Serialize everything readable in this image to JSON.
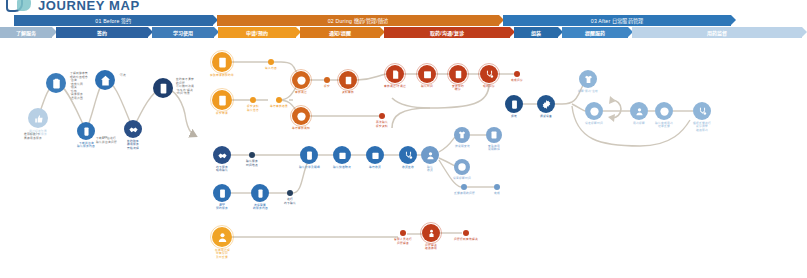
{
  "header": {
    "title": "JOURNEY MAP",
    "logo_icon": "journey-map-logo-icon"
  },
  "banner": {
    "phases": [
      {
        "id": "before",
        "label": "01 Before  签约",
        "color": "#2d6aa8",
        "width": 199
      },
      {
        "id": "during",
        "label": "02 During  缴药/管理/随访",
        "color": "#d1741f",
        "width": 282
      },
      {
        "id": "after",
        "label": "03 After 日常服药管理",
        "color": "#2e77b8",
        "width": 228
      }
    ],
    "steps": [
      {
        "id": "know-service",
        "label": "了解服务",
        "color": "#9fb8cf",
        "width": 52
      },
      {
        "id": "sign",
        "label": "签约",
        "color": "#2d62a0",
        "width": 92
      },
      {
        "id": "learn-use",
        "label": "学习使用",
        "color": "#3f7cb8",
        "width": 62
      },
      {
        "id": "apply-book",
        "label": "申请/预约",
        "color": "#ef9a21",
        "width": 78
      },
      {
        "id": "remind-remind",
        "label": "通知/提醒",
        "color": "#d97a1c",
        "width": 80
      },
      {
        "id": "take-comm-visit",
        "label": "取药/沟通/复诊",
        "color": "#bf3d1b",
        "width": 126
      },
      {
        "id": "assemble",
        "label": "组装",
        "color": "#2a6ba8",
        "width": 44
      },
      {
        "id": "continue-service",
        "label": "提醒服药",
        "color": "#3f86c4",
        "width": 66
      },
      {
        "id": "medication-supervise",
        "label": "用药监督",
        "color": "#bcd3e8",
        "width": 170
      }
    ]
  },
  "sections": {
    "before": {
      "nodes": [
        {
          "id": "b1",
          "icon": "thumbs-up-icon",
          "label": "通过好友/下属\n推荐分享服务",
          "color": "#b7cfe4",
          "x": 38,
          "y": 118,
          "r": 10
        },
        {
          "id": "b2",
          "icon": "clipboard-icon",
          "label": "",
          "color": "#3b7cba",
          "x": 56,
          "y": 83,
          "r": 10
        },
        {
          "id": "b3",
          "icon": "phone-icon",
          "label": "下载并咨询\n确认服务内容",
          "color": "#2f72b4",
          "x": 86,
          "y": 131,
          "r": 9
        },
        {
          "id": "b4",
          "icon": "home-icon",
          "label": "",
          "color": "#2d6fb2",
          "x": 105,
          "y": 80,
          "r": 10
        },
        {
          "id": "b5",
          "icon": "handshake-icon",
          "label": "签约购买\n使用服务\n开始流程",
          "color": "#2a4f86",
          "x": 133,
          "y": 129,
          "r": 9
        },
        {
          "id": "b6",
          "icon": "tablet-icon",
          "label": "",
          "color": "#1f3f6e",
          "x": 163,
          "y": 88,
          "r": 10
        }
      ],
      "notes": [
        {
          "id": "b2-note",
          "text": "了解到健康管\n理的价值理念\n·咨询\n·自我认同\n·相关\n·价格\n·具体服务\n·适用范围",
          "x": 70,
          "y": 72
        },
        {
          "id": "b4-note",
          "text": "·可选",
          "x": 119,
          "y": 74
        },
        {
          "id": "b6-note",
          "text": "签约有不清楚\n的问题\n可以随时沟通\n·怎么办·解决\n·时间·效果",
          "x": 176,
          "y": 78
        },
        {
          "id": "b3-note",
          "text": "下载APP后进行\n确认并咨询问题",
          "x": 96,
          "y": 137
        },
        {
          "id": "b1-note",
          "text": "推荐好友/下\n属使用该服务",
          "x": 24,
          "y": 133
        }
      ]
    },
    "during": {
      "orange_nodes": [
        {
          "id": "d1",
          "icon": "form-icon",
          "label": "获取申请表/预约单",
          "color": "#ef9a21",
          "x": 222,
          "y": 62,
          "r": 10
        },
        {
          "id": "d2",
          "icon": "form-icon",
          "label": "提交申请",
          "color": "#ef9a21",
          "x": 222,
          "y": 100,
          "r": 10
        },
        {
          "id": "d3",
          "icon": "check-circle-icon",
          "label": "审核通过",
          "color": "#d2661d",
          "x": 301,
          "y": 80,
          "r": 9
        },
        {
          "id": "d4",
          "icon": "alert-circle-icon",
          "label": "等待审核通知",
          "color": "#d2661d",
          "x": 301,
          "y": 116,
          "r": 9
        },
        {
          "id": "d5",
          "icon": "doc-review-icon",
          "label": "资料审核",
          "color": "#c6501a",
          "x": 348,
          "y": 80,
          "r": 9
        },
        {
          "id": "d6",
          "icon": "file-icon",
          "label": "审核通过/不通过",
          "color": "#bf3d1b",
          "x": 395,
          "y": 74,
          "r": 9
        },
        {
          "id": "d7",
          "icon": "calendar-icon",
          "label": "确认时间",
          "color": "#bf3d1b",
          "x": 427,
          "y": 74,
          "r": 9
        },
        {
          "id": "d8",
          "icon": "list-icon",
          "label": "安排预约\n/就诊",
          "color": "#bf3d1b",
          "x": 458,
          "y": 74,
          "r": 9
        },
        {
          "id": "d9",
          "icon": "stethoscope-icon",
          "label": "现场问诊",
          "color": "#bf3d1b",
          "x": 489,
          "y": 74,
          "r": 9
        }
      ],
      "orange_dots": [
        {
          "id": "dd1",
          "label": "填入内容",
          "color": "#ef9a21",
          "x": 271,
          "y": 62,
          "r": 3.4
        },
        {
          "id": "dd2",
          "label": "提交资料\n确认信息",
          "color": "#ef9a21",
          "x": 253,
          "y": 100,
          "r": 3.4
        },
        {
          "id": "dd3",
          "label": "等待审核结果",
          "color": "#ef9a21",
          "x": 279,
          "y": 100,
          "r": 3.4
        },
        {
          "id": "dd4",
          "label": "提交",
          "color": "#d2661d",
          "x": 327,
          "y": 80,
          "r": 3
        },
        {
          "id": "dd5",
          "label": "再次确认\n提交资料",
          "color": "#bf3d1b",
          "x": 382,
          "y": 116,
          "r": 3
        },
        {
          "id": "dd6",
          "label": "完成问诊",
          "color": "#bf3d1b",
          "x": 517,
          "y": 74,
          "r": 3
        }
      ],
      "blue_nodes": [
        {
          "id": "e1",
          "icon": "handshake-icon",
          "label": "线下服务\n现场确认",
          "color": "#2a4f86",
          "x": 222,
          "y": 155,
          "r": 9
        },
        {
          "id": "e2",
          "icon": "tablet-icon",
          "label": "APP\n预约服务",
          "color": "#2d6fb2",
          "x": 222,
          "y": 193,
          "r": 9
        },
        {
          "id": "e3",
          "icon": "phone-icon",
          "label": "选择需要\n的服务内容",
          "color": "#2d6fb2",
          "x": 260,
          "y": 193,
          "r": 9
        },
        {
          "id": "e4",
          "icon": "tablet-icon",
          "label": "确认订单及明细",
          "color": "#2d6fb2",
          "x": 309,
          "y": 155,
          "r": 9
        },
        {
          "id": "e5",
          "icon": "box-add-icon",
          "label": "确认快递/物流",
          "color": "#2d6fb2",
          "x": 342,
          "y": 155,
          "r": 9
        },
        {
          "id": "e6",
          "icon": "box-add-icon",
          "label": "等待收货",
          "color": "#2d6fb2",
          "x": 375,
          "y": 155,
          "r": 9
        },
        {
          "id": "e7",
          "icon": "stethoscope-icon",
          "label": "收货签收",
          "color": "#2d6fb2",
          "x": 408,
          "y": 155,
          "r": 9
        },
        {
          "id": "e8",
          "icon": "user-check-icon",
          "label": "确认\n收货",
          "color": "#6f9bc9",
          "x": 430,
          "y": 155,
          "r": 9
        },
        {
          "id": "e9",
          "icon": "shirt-icon",
          "label": "按说明安装",
          "color": "#7fa6cf",
          "x": 462,
          "y": 135,
          "r": 8
        },
        {
          "id": "e10",
          "icon": "list-icon",
          "label": "查看使用\n说明/教程",
          "color": "#7fa6cf",
          "x": 494,
          "y": 135,
          "r": 8
        },
        {
          "id": "e11",
          "icon": "clock-icon",
          "label": "设置提醒时间",
          "color": "#7fa6cf",
          "x": 462,
          "y": 167,
          "r": 8
        }
      ],
      "blue_dots": [
        {
          "id": "ed1",
          "label": "确认服务\n时间地点",
          "color": "#27415f",
          "x": 252,
          "y": 155,
          "r": 3
        },
        {
          "id": "ed2",
          "label": "进行\n线下确认",
          "color": "#27415f",
          "x": 290,
          "y": 193,
          "r": 3
        },
        {
          "id": "ed3",
          "label": "反馈使用的问题",
          "color": "#6f9bc9",
          "x": 464,
          "y": 187,
          "r": 3
        },
        {
          "id": "ed4",
          "label": "完成",
          "color": "#6f9bc9",
          "x": 497,
          "y": 187,
          "r": 3
        }
      ],
      "bottom": {
        "start": {
          "id": "f1",
          "icon": "user-icon",
          "label": "在使用过程\n中有疑问\n及时反馈",
          "color": "#f0a426",
          "x": 222,
          "y": 237,
          "r": 10
        },
        "mid_dot": {
          "id": "f2",
          "label": "客服人员进行\n问题解答",
          "color": "#bf3d1b",
          "x": 403,
          "y": 233,
          "r": 3.4
        },
        "node": {
          "id": "f3",
          "icon": "person-icon",
          "label": "问题解决\n继续使用",
          "color": "#bf3d1b",
          "x": 431,
          "y": 233,
          "r": 9
        },
        "end_dot": {
          "id": "f4",
          "label": "问题得到有效解决",
          "color": "#bf3d1b",
          "x": 466,
          "y": 233,
          "r": 3.4
        }
      }
    },
    "after": {
      "nodes": [
        {
          "id": "a1",
          "icon": "tablet-icon",
          "label": "组装",
          "color": "#1f4e84",
          "x": 514,
          "y": 104,
          "r": 9
        },
        {
          "id": "a2",
          "icon": "gear-icon",
          "label": "调试设备",
          "color": "#24578f",
          "x": 546,
          "y": 104,
          "r": 9
        },
        {
          "id": "a3",
          "icon": "shirt-icon",
          "label": "提醒·服药·注射",
          "color": "#8fb5d8",
          "x": 588,
          "y": 79,
          "r": 9
        },
        {
          "id": "a4",
          "icon": "clock-icon",
          "label": "设定提醒时间",
          "color": "#8fb5d8",
          "x": 594,
          "y": 111,
          "r": 9
        },
        {
          "id": "a5",
          "icon": "user-check-icon",
          "label": "用药提醒",
          "color": "#8fb5d8",
          "x": 639,
          "y": 111,
          "r": 9
        },
        {
          "id": "a6",
          "icon": "clock-icon",
          "label": "确认完成用药\n记录反馈",
          "color": "#8fb5d8",
          "x": 664,
          "y": 111,
          "r": 9
        },
        {
          "id": "a7",
          "icon": "stethoscope-icon",
          "label": "根据反馈进行\n复诊调整\n继续服药",
          "color": "#8fb5d8",
          "x": 702,
          "y": 111,
          "r": 9
        }
      ],
      "loop_label": "循环"
    }
  },
  "colors": {
    "blue_dark": "#1f3f6e",
    "blue": "#2d6fb2",
    "blue_light": "#8fb5d8",
    "orange": "#ef9a21",
    "orange_dark": "#d2661d",
    "red": "#bf3d1b",
    "line": "#cfc8bc"
  }
}
